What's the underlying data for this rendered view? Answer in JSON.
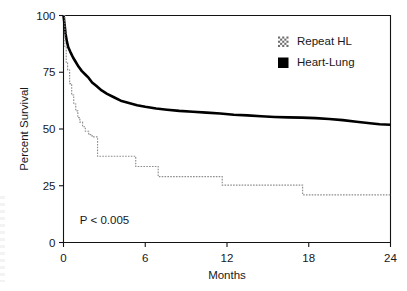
{
  "chart_data": {
    "type": "line",
    "subtype": "kaplan-meier-survival",
    "title": "",
    "xlabel": "Months",
    "ylabel": "Percent Survival",
    "xlim": [
      0,
      24
    ],
    "ylim": [
      0,
      100
    ],
    "xticks": [
      0,
      6,
      12,
      18,
      24
    ],
    "yticks": [
      0,
      25,
      50,
      75,
      100
    ],
    "xtick_labels": [
      "0",
      "6",
      "12",
      "18",
      "24"
    ],
    "ytick_labels": [
      "0",
      "25",
      "50",
      "75",
      "100"
    ],
    "grid": false,
    "legend_position": "top-right",
    "annotations": [
      {
        "text": "P < 0.005",
        "x": 1.2,
        "y": 8
      }
    ],
    "series": [
      {
        "name": "Heart-Lung",
        "style": "solid-thick-black",
        "color": "#000000",
        "points": [
          [
            0.0,
            100
          ],
          [
            0.08,
            96
          ],
          [
            0.15,
            92
          ],
          [
            0.25,
            88.5
          ],
          [
            0.35,
            86
          ],
          [
            0.5,
            84
          ],
          [
            0.7,
            81.5
          ],
          [
            0.9,
            79.5
          ],
          [
            1.1,
            77.5
          ],
          [
            1.35,
            75.5
          ],
          [
            1.6,
            74
          ],
          [
            1.85,
            72.5
          ],
          [
            2.1,
            70.5
          ],
          [
            2.4,
            69
          ],
          [
            2.8,
            67
          ],
          [
            3.2,
            65.5
          ],
          [
            3.7,
            64
          ],
          [
            4.2,
            62.5
          ],
          [
            4.8,
            61.5
          ],
          [
            5.4,
            60.5
          ],
          [
            6.0,
            59.8
          ],
          [
            6.8,
            59
          ],
          [
            7.6,
            58.5
          ],
          [
            8.5,
            58
          ],
          [
            9.5,
            57.6
          ],
          [
            10.5,
            57.2
          ],
          [
            11.5,
            56.8
          ],
          [
            12.5,
            56.3
          ],
          [
            13.5,
            56.0
          ],
          [
            14.5,
            55.6
          ],
          [
            15.5,
            55.3
          ],
          [
            16.5,
            55.1
          ],
          [
            17.5,
            55.0
          ],
          [
            18.5,
            54.8
          ],
          [
            19.5,
            54.4
          ],
          [
            20.5,
            53.9
          ],
          [
            21.5,
            53.2
          ],
          [
            22.5,
            52.5
          ],
          [
            23.2,
            52.1
          ],
          [
            24.0,
            51.9
          ]
        ]
      },
      {
        "name": "Repeat HL",
        "style": "dotted-thin-gray-step",
        "color": "#8d8d8d",
        "step": "post",
        "points": [
          [
            0.0,
            100
          ],
          [
            0.1,
            86
          ],
          [
            0.2,
            79
          ],
          [
            0.3,
            76
          ],
          [
            0.45,
            70
          ],
          [
            0.6,
            65
          ],
          [
            0.75,
            61
          ],
          [
            0.9,
            58
          ],
          [
            1.05,
            55
          ],
          [
            1.2,
            53
          ],
          [
            1.4,
            51
          ],
          [
            1.6,
            49
          ],
          [
            1.85,
            47.5
          ],
          [
            2.1,
            46.5
          ],
          [
            2.45,
            46.5
          ],
          [
            2.5,
            38
          ],
          [
            5.25,
            38
          ],
          [
            5.3,
            33.5
          ],
          [
            6.9,
            33.5
          ],
          [
            6.95,
            29
          ],
          [
            11.6,
            29
          ],
          [
            11.65,
            25.3
          ],
          [
            17.5,
            25.3
          ],
          [
            17.55,
            21
          ],
          [
            24.0,
            21
          ]
        ]
      }
    ]
  },
  "legend": {
    "items": [
      {
        "label": "Repeat HL",
        "swatch": "dither-gray-swatch"
      },
      {
        "label": "Heart-Lung",
        "swatch": "solid-black-swatch"
      }
    ]
  },
  "axes": {
    "y_title": "Percent Survival",
    "x_title": "Months"
  },
  "colors": {
    "heart_lung": "#000000",
    "repeat_hl": "#8d8d8d",
    "axis": "#111315",
    "background": "#ffffff"
  }
}
